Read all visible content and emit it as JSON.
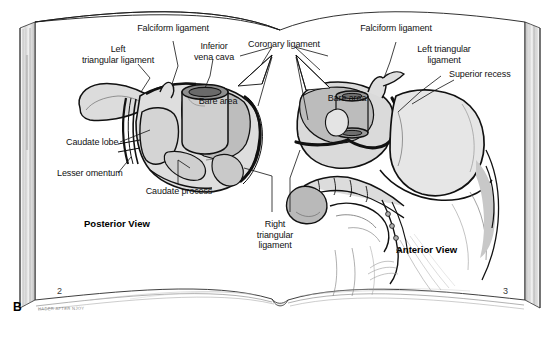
{
  "figure": {
    "panel_letter": "B",
    "artist_signature": "HADER AFTER NJOY",
    "background_color": "#ffffff",
    "ink_color": "#111111",
    "shade_light": "#e2e2e2",
    "shade_mid": "#c6c6c6",
    "shade_dark": "#a8a8a8"
  },
  "book": {
    "left_page": {
      "page_number": "2",
      "view_label": "Posterior View",
      "labels": [
        {
          "id": "falciform-ligament",
          "text": "Falciform ligament"
        },
        {
          "id": "left-triangular-ligament",
          "text": "Left\ntriangular ligament"
        },
        {
          "id": "inferior-vena-cava",
          "text": "Inferior\nvena cava"
        },
        {
          "id": "bare-area",
          "text": "Bare area"
        },
        {
          "id": "caudate-lobe",
          "text": "Caudate lobe"
        },
        {
          "id": "lesser-omentum",
          "text": "Lesser omentum"
        },
        {
          "id": "caudate-process",
          "text": "Caudate process"
        }
      ]
    },
    "right_page": {
      "page_number": "3",
      "view_label": "Anterior View",
      "labels": [
        {
          "id": "falciform-ligament",
          "text": "Falciform ligament"
        },
        {
          "id": "left-triangular-ligament",
          "text": "Left triangular\nligament"
        },
        {
          "id": "superior-recess",
          "text": "Superior recess"
        },
        {
          "id": "bare-area",
          "text": "Bare area"
        }
      ]
    },
    "shared_labels": [
      {
        "id": "coronary-ligament",
        "text": "Coronary ligament"
      },
      {
        "id": "right-triangular-ligament",
        "text": "Right\ntriangular\nligament"
      }
    ]
  }
}
